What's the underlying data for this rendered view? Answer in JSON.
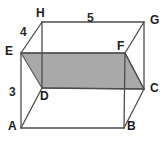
{
  "figure": {
    "type": "rectangular-prism",
    "background_color": "#ffffff",
    "stroke_color": "#4d4d4d",
    "shaded_face_fill": "#a9a9a9",
    "shaded_face_stroke": "#5a5a5a",
    "label_color": "#1c1c1c",
    "vertices": [
      {
        "name": "A",
        "label": "A",
        "x": 21,
        "y": 128,
        "label_x": 8,
        "label_y": 120
      },
      {
        "name": "B",
        "label": "B",
        "x": 124,
        "y": 128,
        "label_x": 127,
        "label_y": 120
      },
      {
        "name": "C",
        "label": "C",
        "x": 144,
        "y": 89,
        "label_x": 150,
        "label_y": 82
      },
      {
        "name": "D",
        "label": "D",
        "x": 42,
        "y": 88,
        "label_x": 40,
        "label_y": 90
      },
      {
        "name": "E",
        "label": "E",
        "x": 21,
        "y": 53,
        "label_x": 5,
        "label_y": 45
      },
      {
        "name": "F",
        "label": "F",
        "x": 125,
        "y": 53,
        "label_x": 117,
        "label_y": 40
      },
      {
        "name": "G",
        "label": "G",
        "x": 144,
        "y": 22,
        "label_x": 150,
        "label_y": 14
      },
      {
        "name": "H",
        "label": "H",
        "x": 42,
        "y": 22,
        "label_x": 36,
        "label_y": 7
      }
    ],
    "edge_labels": [
      {
        "name": "edge-eh-length",
        "text": "4",
        "x": 20,
        "y": 26,
        "edge": "EH"
      },
      {
        "name": "edge-hg-length",
        "text": "5",
        "x": 87,
        "y": 12,
        "edge": "HG"
      },
      {
        "name": "edge-ae-length",
        "text": "3",
        "x": 9,
        "y": 86,
        "edge": "AE"
      }
    ],
    "shaded_face": {
      "name": "cross-section-EFCD",
      "vertices": [
        "E",
        "F",
        "C",
        "D"
      ],
      "points": "21,53 125,53 144,89 42,88"
    },
    "edges": [
      {
        "name": "edge-A-B",
        "from": "A",
        "to": "B",
        "hidden": false
      },
      {
        "name": "edge-B-C",
        "from": "B",
        "to": "C",
        "hidden": false
      },
      {
        "name": "edge-A-E",
        "from": "A",
        "to": "E",
        "hidden": false
      },
      {
        "name": "edge-A-D",
        "from": "A",
        "to": "D",
        "hidden": false
      },
      {
        "name": "edge-D-C",
        "from": "D",
        "to": "C",
        "hidden": false
      },
      {
        "name": "edge-D-H",
        "from": "D",
        "to": "H",
        "hidden": false
      },
      {
        "name": "edge-E-H",
        "from": "E",
        "to": "H",
        "hidden": false
      },
      {
        "name": "edge-E-F",
        "from": "E",
        "to": "F",
        "hidden": false
      },
      {
        "name": "edge-H-G",
        "from": "H",
        "to": "G",
        "hidden": false
      },
      {
        "name": "edge-G-F",
        "from": "G",
        "to": "F",
        "hidden": false
      },
      {
        "name": "edge-G-C",
        "from": "G",
        "to": "C",
        "hidden": false
      },
      {
        "name": "edge-F-C",
        "from": "F",
        "to": "C",
        "hidden": false
      },
      {
        "name": "edge-F-B",
        "from": "F",
        "to": "B",
        "hidden": false
      }
    ]
  }
}
